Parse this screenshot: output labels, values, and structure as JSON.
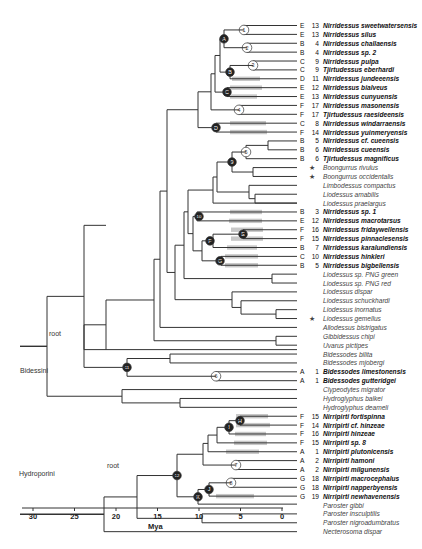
{
  "figure": {
    "axis": {
      "label": "Mya",
      "ticks": [
        30,
        25,
        20,
        15,
        10,
        5,
        0
      ]
    },
    "groups": [
      {
        "name": "Bidessini",
        "root_label": "root"
      },
      {
        "name": "Hydroporini",
        "root_label": "root"
      }
    ],
    "taxa": [
      {
        "code": "E",
        "num": "13",
        "name": "Nirridessus sweetwatersensis",
        "bold": true
      },
      {
        "code": "E",
        "num": "13",
        "name": "Nirridessus silus",
        "bold": true
      },
      {
        "code": "B",
        "num": "4",
        "name": "Nirridessus challaensis",
        "bold": true
      },
      {
        "code": "B",
        "num": "4",
        "name": "Nirridessus sp. 2",
        "bold": true
      },
      {
        "code": "C",
        "num": "9",
        "name": "Nirridessus pulpa",
        "bold": true
      },
      {
        "code": "C",
        "num": "9",
        "name": "Tjirtudessus eberhardi",
        "bold": true
      },
      {
        "code": "D",
        "num": "11",
        "name": "Nirridessus jundeeensis",
        "bold": true
      },
      {
        "code": "E",
        "num": "12",
        "name": "Nirridessus bialveus",
        "bold": true
      },
      {
        "code": "E",
        "num": "13",
        "name": "Nirridessus cunyuensis",
        "bold": true
      },
      {
        "code": "F",
        "num": "17",
        "name": "Nirridessus masonensis",
        "bold": true
      },
      {
        "code": "F",
        "num": "17",
        "name": "Tjirtudessus raesideensis",
        "bold": true
      },
      {
        "code": "C",
        "num": "8",
        "name": "Nirridessus windarraensis",
        "bold": true
      },
      {
        "code": "F",
        "num": "14",
        "name": "Nirridessus yuinmeryensis",
        "bold": true
      },
      {
        "code": "B",
        "num": "5",
        "name": "Nirridessus cf. cueensis",
        "bold": true
      },
      {
        "code": "B",
        "num": "6",
        "name": "Nirridessus cueensis",
        "bold": true
      },
      {
        "code": "B",
        "num": "6",
        "name": "Tjirtudessus magnificus",
        "bold": true
      },
      {
        "code": "",
        "num": "",
        "star": true,
        "name": "Boongurrus rivulus",
        "bold": false
      },
      {
        "code": "",
        "num": "",
        "star": true,
        "name": "Boongurrus occidentalis",
        "bold": false
      },
      {
        "code": "",
        "num": "",
        "name": "Limbodessus compactus",
        "bold": false
      },
      {
        "code": "",
        "num": "",
        "name": "Liodessus amabilis",
        "bold": false
      },
      {
        "code": "",
        "num": "",
        "name": "Liodessus praelargus",
        "bold": false
      },
      {
        "code": "B",
        "num": "3",
        "name": "Nirridessus sp. 1",
        "bold": true
      },
      {
        "code": "E",
        "num": "12",
        "name": "Nirridessus macrotarsus",
        "bold": true
      },
      {
        "code": "F",
        "num": "16",
        "name": "Nirridessus fridaywellensis",
        "bold": true
      },
      {
        "code": "F",
        "num": "15",
        "name": "Nirridessus pinnaclesensis",
        "bold": true
      },
      {
        "code": "B",
        "num": "7",
        "name": "Nirridessus karalundiensis",
        "bold": true
      },
      {
        "code": "C",
        "num": "10",
        "name": "Nirridessus hinkleri",
        "bold": true
      },
      {
        "code": "B",
        "num": "5",
        "name": "Nirridessus bigbellensis",
        "bold": true
      },
      {
        "code": "",
        "num": "",
        "name": "Liodessus sp. PNG green",
        "bold": false
      },
      {
        "code": "",
        "num": "",
        "name": "Liodessus sp. PNG red",
        "bold": false
      },
      {
        "code": "",
        "num": "",
        "name": "Liodessus dispar",
        "bold": false
      },
      {
        "code": "",
        "num": "",
        "name": "Liodessus schuckhardi",
        "bold": false
      },
      {
        "code": "",
        "num": "",
        "name": "Liodessus inornatus",
        "bold": false
      },
      {
        "code": "",
        "num": "",
        "star": true,
        "name": "Liodessus gemellus",
        "bold": false
      },
      {
        "code": "",
        "num": "",
        "name": "Allodessus bistrigatus",
        "bold": false
      },
      {
        "code": "",
        "num": "",
        "name": "Gibbidessus chipi",
        "bold": false
      },
      {
        "code": "",
        "num": "",
        "name": "Uvarus pictipes",
        "bold": false
      },
      {
        "code": "",
        "num": "",
        "name": "Bidessodes bilita",
        "bold": false
      },
      {
        "code": "",
        "num": "",
        "name": "Bidessodes mjobergi",
        "bold": false
      },
      {
        "code": "A",
        "num": "1",
        "name": "Bidessodes limestonensis",
        "bold": true
      },
      {
        "code": "A",
        "num": "1",
        "name": "Bidessodes gutteridgei",
        "bold": true
      },
      {
        "code": "",
        "num": "",
        "name": "Clypeodytes migrator",
        "bold": false
      },
      {
        "code": "",
        "num": "",
        "name": "Hydroglyphus balkei",
        "bold": false
      },
      {
        "code": "",
        "num": "",
        "name": "Hydroglyphus deameli",
        "bold": false
      },
      {
        "code": "F",
        "num": "15",
        "name": "Nirripirti fortispinna",
        "bold": true
      },
      {
        "code": "F",
        "num": "14",
        "name": "Nirripirti cf. hinzeae",
        "bold": true
      },
      {
        "code": "F",
        "num": "16",
        "name": "Nirripirti hinzeae",
        "bold": true
      },
      {
        "code": "F",
        "num": "15",
        "name": "Nirripirti sp. 8",
        "bold": true
      },
      {
        "code": "A",
        "num": "1",
        "name": "Nirripirti plutonicensis",
        "bold": true
      },
      {
        "code": "A",
        "num": "2",
        "name": "Nirripirti hamoni",
        "bold": true
      },
      {
        "code": "A",
        "num": "2",
        "name": "Nirripirti milgunensis",
        "bold": true
      },
      {
        "code": "G",
        "num": "18",
        "name": "Nirripirti macrocephalus",
        "bold": true
      },
      {
        "code": "G",
        "num": "18",
        "name": "Nirripirti napperbyensis",
        "bold": true
      },
      {
        "code": "G",
        "num": "19",
        "name": "Nirripirti newhavenensis",
        "bold": true
      },
      {
        "code": "",
        "num": "",
        "name": "Paroster gibbi",
        "bold": false
      },
      {
        "code": "",
        "num": "",
        "name": "Paroster insculptilis",
        "bold": false
      },
      {
        "code": "",
        "num": "",
        "name": "Paroster nigroadumbratus",
        "bold": false
      },
      {
        "code": "",
        "num": "",
        "name": "Necterosoma dispar",
        "bold": false
      }
    ],
    "node_markers": {
      "open_circles": [
        "1",
        "2",
        "3",
        "4",
        "5",
        "6",
        "7",
        "8"
      ],
      "filled_circles": [
        "A",
        "B",
        "C",
        "D",
        "E",
        "F",
        "G",
        "H",
        "I",
        "J",
        "K",
        "9",
        "10",
        "11",
        "12"
      ]
    },
    "colors": {
      "branch": "#333333",
      "bar": "#c8c8c8",
      "filled_node": "#222222",
      "open_node": "#ffffff"
    }
  }
}
